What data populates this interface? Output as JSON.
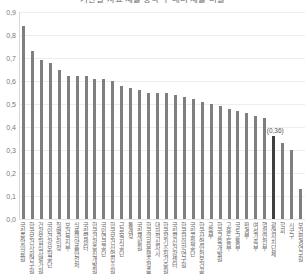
{
  "chart_data": {
    "type": "bar",
    "title": "기관별 자료 제출 항목 수 대비 제출 비율",
    "xlabel": "",
    "ylabel": "",
    "ylim": [
      0.0,
      0.9
    ],
    "ytick_labels": [
      "0,9",
      "0,8",
      "0,7",
      "0,6",
      "0,5",
      "0,4",
      "0,3",
      "0,2",
      "0,1",
      "0,0"
    ],
    "ytick_values": [
      0.9,
      0.8,
      0.7,
      0.6,
      0.5,
      0.4,
      0.3,
      0.2,
      0.1,
      0.0
    ],
    "decimal_separator": ",",
    "grid": true,
    "legend": false,
    "bar_color": "#7f7f7f",
    "highlight_color": "#404040",
    "highlighted_index": 28,
    "annotations": [
      {
        "index": 28,
        "text": "(0,36)",
        "value": 0.36
      }
    ],
    "categories": [
      "국립중앙의료원",
      "한국보건사회연구원",
      "건강보험심사평가원",
      "국민건강보험공단",
      "질병관리청",
      "보건복지부",
      "식품의약품안전처",
      "국립암센터",
      "한국건강증진개발원",
      "국민연금공단",
      "한국보건산업진흥원",
      "근로복지공단",
      "통계청",
      "국립재활원",
      "한국의료분쟁조정중재원",
      "대한적십자사",
      "한국장기조직기증원",
      "국립정신건강센터",
      "한국한의학연구원",
      "국립공원공단",
      "한국산업안전보건공단",
      "교육부",
      "한국교육개발원",
      "고용노동부",
      "국토교통부",
      "환경부",
      "여성가족부",
      "행정안전부",
      "광역자치단체",
      "학회",
      "시군구",
      "보건환경연구원"
    ],
    "values": [
      0.84,
      0.73,
      0.69,
      0.68,
      0.65,
      0.62,
      0.62,
      0.62,
      0.61,
      0.61,
      0.6,
      0.58,
      0.57,
      0.56,
      0.55,
      0.55,
      0.55,
      0.54,
      0.53,
      0.52,
      0.51,
      0.5,
      0.49,
      0.48,
      0.47,
      0.46,
      0.45,
      0.44,
      0.36,
      0.33,
      0.3,
      0.13
    ]
  }
}
